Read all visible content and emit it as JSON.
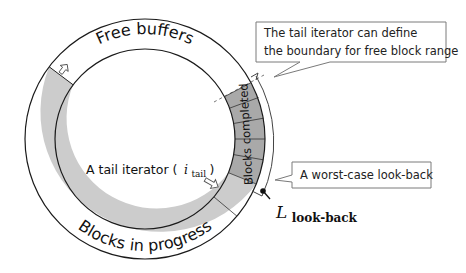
{
  "diagram": {
    "type": "ring-buffer",
    "center": [
      145,
      139
    ],
    "outer_radius": 120,
    "inner_radius": 90,
    "colors": {
      "free": "#ffffff",
      "in_progress": "#cccccc",
      "completed": "#a9a9a9",
      "stroke": "#1a1a1a",
      "callout_border": "#7a7a7a"
    },
    "segments": [
      {
        "name": "free-buffers",
        "label": "Free buffers",
        "start_deg": 217,
        "end_deg": 332
      },
      {
        "name": "blocks-completed",
        "label": "Blocks completed",
        "start_deg": -28,
        "end_deg": 22,
        "block_count": 5
      },
      {
        "name": "blocks-in-progress",
        "label": "Blocks in progress",
        "start_deg": 22,
        "end_deg": 217
      }
    ],
    "labels": {
      "free_buffers": "Free buffers",
      "blocks_completed": "Blocks completed",
      "blocks_in_progress": "Blocks in progress",
      "tail_iterator_prefix": "A tail iterator (",
      "tail_iterator_symbol": "i",
      "tail_iterator_subscript": "tail",
      "tail_iterator_suffix": ")",
      "lookback_symbol": "L",
      "lookback_subscript": "look-back"
    },
    "callouts": [
      {
        "name": "tail-boundary-callout",
        "lines": [
          "The tail iterator can define",
          "the boundary for free block range"
        ]
      },
      {
        "name": "worst-case-callout",
        "lines": [
          "A worst-case look-back"
        ]
      }
    ]
  }
}
